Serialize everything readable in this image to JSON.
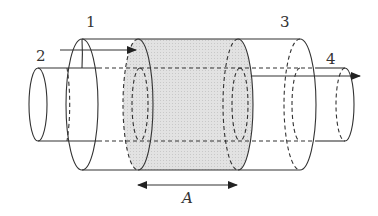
{
  "diagram": {
    "type": "coaxial cylinders cross-section",
    "labels": {
      "l1": "1",
      "l2": "2",
      "l3": "3",
      "l4": "4",
      "a": "A"
    },
    "colors": {
      "line": "#333333",
      "shade": "#dcdcdc",
      "background": "#ffffff"
    },
    "elements": [
      {
        "id": "outer-cylinder",
        "label": "1 / 3"
      },
      {
        "id": "inner-cylinder",
        "label": "2 / 4"
      },
      {
        "id": "shaded-region",
        "label": "A"
      }
    ]
  }
}
